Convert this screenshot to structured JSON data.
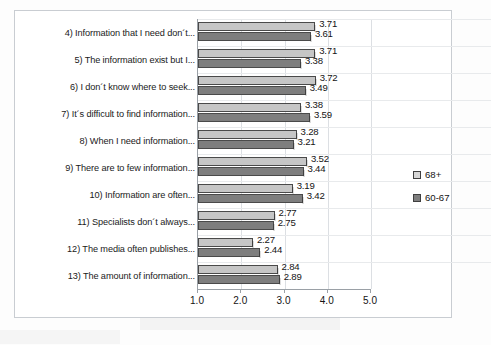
{
  "chart_data": {
    "type": "bar",
    "orientation": "horizontal",
    "title": "",
    "xlabel": "",
    "ylabel": "",
    "xlim": [
      1.0,
      5.0
    ],
    "xticks": [
      "1.0",
      "2.0",
      "3.0",
      "4.0",
      "5.0"
    ],
    "grid": true,
    "legend_position": "right",
    "categories": [
      "4) Information that I need don´t...",
      "5) The information exist but I...",
      "6) I don´t know where to seek...",
      "7) It´s difficult to find information...",
      "8) When I need information...",
      "9) There are to few information...",
      "10) Information are often...",
      "11) Specialists don´t always...",
      "12) The media often publishes...",
      "13) The amount of information..."
    ],
    "series": [
      {
        "name": "68+",
        "color": "#c6c6c6",
        "values": [
          3.71,
          3.71,
          3.72,
          3.38,
          3.28,
          3.52,
          3.19,
          2.77,
          2.27,
          2.84
        ],
        "labels": [
          "3.71",
          "3.71",
          "3.72",
          "3.38",
          "3.28",
          "3.52",
          "3.19",
          "2.77",
          "2.27",
          "2.84"
        ]
      },
      {
        "name": "60-67",
        "color": "#7e7e7e",
        "values": [
          3.61,
          3.38,
          3.49,
          3.59,
          3.21,
          3.44,
          3.42,
          2.75,
          2.44,
          2.89
        ],
        "labels": [
          "3.61",
          "3.38",
          "3.49",
          "3.59",
          "3.21",
          "3.44",
          "3.42",
          "2.75",
          "2.44",
          "2.89"
        ]
      }
    ]
  }
}
